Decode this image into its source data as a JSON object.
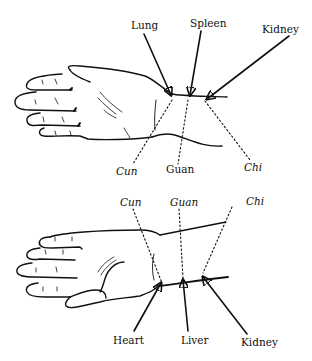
{
  "figure": {
    "top_panel": {
      "view": "dorsal hand, right wrist pulse positions",
      "organ_labels": [
        "Lung",
        "Spleen",
        "Kidney"
      ],
      "position_labels": [
        "Cun",
        "Guan",
        "Chi"
      ]
    },
    "bottom_panel": {
      "view": "palmar hand, wrist pulse positions",
      "position_labels": [
        "Cun",
        "Guan",
        "Chi"
      ],
      "organ_labels": [
        "Heart",
        "Liver",
        "Kidney"
      ]
    }
  }
}
